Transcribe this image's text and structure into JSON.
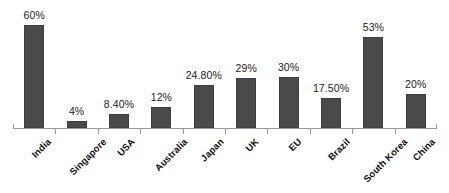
{
  "chart_data": {
    "type": "bar",
    "title": "",
    "subtitle": "",
    "xlabel": "",
    "ylabel": "",
    "grid": false,
    "legend": false,
    "axis": {
      "y_min": 0,
      "y_max": 70,
      "x_axis_visible": true,
      "y_axis_visible": false,
      "tick_marks": "between categories"
    },
    "series_name": "",
    "bar_color": "#4a4a4a",
    "label_color": "#1a1a1a",
    "axis_color": "#9a9a9a",
    "categories": [
      "India",
      "Singapore",
      "USA",
      "Australia",
      "Japan",
      "UK",
      "EU",
      "Brazil",
      "South Korea",
      "China"
    ],
    "values": [
      60,
      4,
      8.4,
      12,
      24.8,
      29,
      30,
      17.5,
      53,
      20
    ],
    "data_labels": [
      "60%",
      "4%",
      "8.40%",
      "12%",
      "24.80%",
      "29%",
      "30%",
      "17.50%",
      "53%",
      "20%"
    ]
  }
}
